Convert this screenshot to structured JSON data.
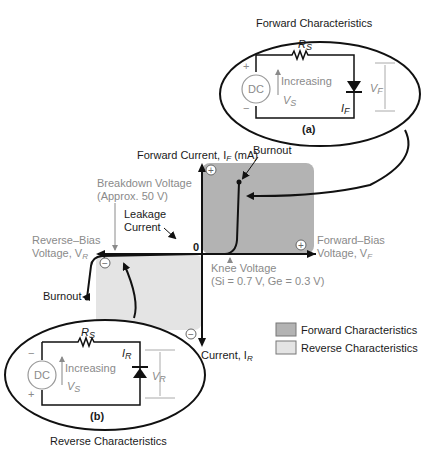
{
  "diagram": {
    "type": "diode-iv-characteristics",
    "colors": {
      "forward_region": "#b3b3b3",
      "reverse_region": "#e4e4e4",
      "curve": "#111111",
      "muted_text": "#8a8a8a",
      "text": "#1a1a1a"
    },
    "forward_circuit": {
      "title": "Forward Characteristics",
      "caption": "(a)",
      "resistor_label": "R",
      "resistor_sub": "S",
      "source_label": "DC",
      "plus": "+",
      "minus": "−",
      "increasing_label": "Increasing",
      "vs_label": "V",
      "vs_sub": "S",
      "current_label": "I",
      "current_sub": "F",
      "voltage_label": "V",
      "voltage_sub": "F"
    },
    "reverse_circuit": {
      "title": "Reverse Characteristics",
      "caption": "(b)",
      "resistor_label": "R",
      "resistor_sub": "S",
      "source_label": "DC",
      "plus": "+",
      "minus": "−",
      "increasing_label": "Increasing",
      "vs_label": "V",
      "vs_sub": "S",
      "current_label": "I",
      "current_sub": "R",
      "voltage_label": "V",
      "voltage_sub": "R"
    },
    "axes": {
      "y_positive_label": "Forward Current, I",
      "y_positive_sub": "F",
      "y_positive_unit": " (mA)",
      "y_negative_label": "Reverse Current, I",
      "y_negative_sub": "R",
      "x_positive_line1": "Forward–Bias",
      "x_positive_line2": "Voltage, V",
      "x_positive_sub": "F",
      "x_negative_line1": "Reverse–Bias",
      "x_negative_line2": "Voltage, V",
      "x_negative_sub": "R",
      "origin": "0",
      "plus_sign": "+",
      "minus_sign": "−"
    },
    "annotations": {
      "burnout_forward": "Burnout",
      "burnout_reverse": "Burnout",
      "breakdown_line1": "Breakdown Voltage",
      "breakdown_line2": "(Approx. 50 V)",
      "leakage_line1": "Leakage",
      "leakage_line2": "Current",
      "knee_line1": "Knee Voltage",
      "knee_line2": "(Si = 0.7 V, Ge = 0.3 V)"
    },
    "legend": [
      {
        "label": "Forward Characteristics",
        "color": "#b3b3b3"
      },
      {
        "label": "Reverse Characteristics",
        "color": "#e4e4e4"
      }
    ]
  }
}
